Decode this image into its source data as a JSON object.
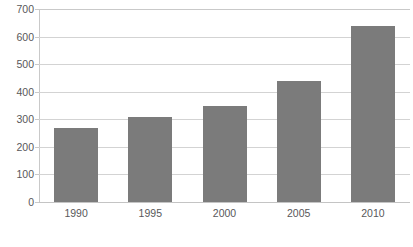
{
  "chart_data": {
    "type": "bar",
    "title": "",
    "xlabel": "",
    "ylabel": "",
    "categories": [
      "1990",
      "1995",
      "2000",
      "2005",
      "2010"
    ],
    "values": [
      270,
      310,
      350,
      440,
      640
    ],
    "ylim": [
      0,
      700
    ],
    "yticks": [
      0,
      100,
      200,
      300,
      400,
      500,
      600,
      700
    ],
    "ytick_labels": [
      "0",
      "100",
      "200",
      "300",
      "400",
      "500",
      "600",
      "700"
    ],
    "grid": true,
    "legend": false,
    "series": [
      {
        "name": "",
        "values": [
          270,
          310,
          350,
          440,
          640
        ]
      }
    ],
    "colors": {
      "bar_fill": "#7b7b7b",
      "grid_line": "#d3d3d3",
      "axis_line": "#c9c9c9",
      "tick_label": "#58585a",
      "background": "#ffffff"
    }
  }
}
